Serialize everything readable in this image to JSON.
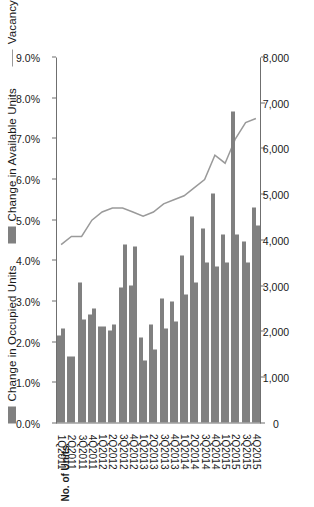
{
  "legend": {
    "items": [
      {
        "label": "Change in Occupied Units",
        "marker": "bar-swatch",
        "color": "#808080"
      },
      {
        "label": "Change in Available Units",
        "marker": "bar-swatch",
        "color": "#808080"
      },
      {
        "label": "Vacancy Rate",
        "marker": "line",
        "color": "#9a9a9a"
      }
    ]
  },
  "axes": {
    "left_title": "No. of Units",
    "left_ticks": [
      "0",
      "1,000",
      "2,000",
      "3,000",
      "4,000",
      "5,000",
      "6,000",
      "7,000",
      "8,000"
    ],
    "right_ticks": [
      "0.0%",
      "1.0%",
      "2.0%",
      "3.0%",
      "4.0%",
      "5.0%",
      "6.0%",
      "7.0%",
      "8.0%",
      "9.0%"
    ]
  },
  "chart_data": {
    "type": "bar",
    "title": "",
    "xlabel": "",
    "ylabel": "No. of Units",
    "y2label": "",
    "ylim": [
      0,
      8000
    ],
    "y2lim": [
      0,
      9
    ],
    "grid": false,
    "legend_position": "top-left",
    "categories": [
      "1Q2011",
      "2Q2011",
      "3Q2011",
      "4Q2011",
      "1Q2012",
      "2Q2012",
      "3Q2012",
      "4Q2012",
      "1Q2013",
      "2Q2013",
      "3Q2013",
      "4Q2013",
      "1Q2014",
      "2Q2014",
      "3Q2014",
      "4Q2014",
      "1Q2015",
      "2Q2015",
      "3Q2015",
      "4Q2015"
    ],
    "series": [
      {
        "name": "Change in Occupied Units",
        "type": "bar",
        "axis": "left",
        "color": "#808080",
        "values": [
          2050,
          1450,
          2250,
          2500,
          2100,
          2150,
          3900,
          3850,
          1350,
          1600,
          2050,
          2200,
          2800,
          3050,
          3500,
          3400,
          3500,
          4100,
          3500,
          4300
        ]
      },
      {
        "name": "Change in Available Units",
        "type": "bar",
        "axis": "left",
        "color": "#808080",
        "values": [
          1900,
          1450,
          3050,
          2350,
          2100,
          2000,
          2950,
          3000,
          1850,
          2150,
          2700,
          2650,
          3650,
          4500,
          4250,
          5000,
          4100,
          6800,
          3950,
          4700
        ]
      },
      {
        "name": "Vacancy Rate",
        "type": "line",
        "axis": "right",
        "color": "#9a9a9a",
        "values": [
          4.4,
          4.6,
          4.6,
          5.0,
          5.2,
          5.3,
          5.3,
          5.2,
          5.1,
          5.2,
          5.4,
          5.5,
          5.6,
          5.8,
          6.0,
          6.6,
          6.4,
          7.0,
          7.4,
          7.5
        ]
      }
    ]
  }
}
